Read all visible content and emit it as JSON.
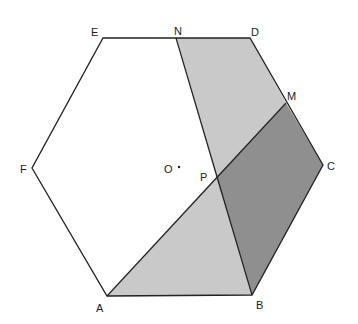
{
  "diagram": {
    "type": "geometry",
    "shape": "regular hexagon ABCDEF with center O",
    "points": {
      "A": [
        107,
        296
      ],
      "B": [
        252,
        295
      ],
      "C": [
        323,
        165
      ],
      "D": [
        250,
        38
      ],
      "E": [
        103,
        38
      ],
      "F": [
        32,
        168
      ],
      "N": [
        176,
        38
      ],
      "M": [
        286,
        103
      ],
      "P": [
        216,
        177
      ],
      "O": [
        177,
        168
      ]
    },
    "labels": {
      "A": "A",
      "B": "B",
      "C": "C",
      "D": "D",
      "E": "E",
      "F": "F",
      "N": "N",
      "M": "M",
      "P": "P",
      "O": "O"
    },
    "regions": [
      {
        "name": "quad-NDMP",
        "vertices": [
          "N",
          "D",
          "M",
          "P"
        ],
        "fill": "#c9c9c9"
      },
      {
        "name": "tri-APB",
        "vertices": [
          "A",
          "P",
          "B"
        ],
        "fill": "#c9c9c9"
      },
      {
        "name": "quad-PMCB",
        "vertices": [
          "P",
          "M",
          "C",
          "B"
        ],
        "fill": "#8f8f8f"
      }
    ],
    "segments": [
      [
        "N",
        "B"
      ],
      [
        "A",
        "M"
      ]
    ],
    "colors": {
      "stroke": "#222222",
      "light_fill": "#c9c9c9",
      "dark_fill": "#8f8f8f"
    }
  }
}
